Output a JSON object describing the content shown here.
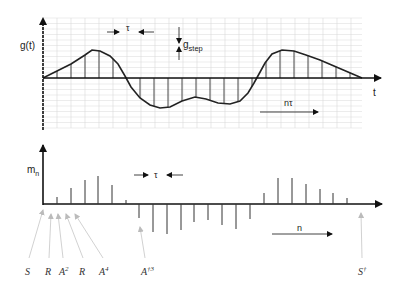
{
  "top_plot": {
    "y_label": "g(t)",
    "x_label": "t",
    "tau_label": "τ",
    "gstep_label_main": "g",
    "gstep_label_sub": "step",
    "ntau_label": "nτ",
    "origin": [
      43,
      78
    ],
    "tau_px": 14,
    "grid": {
      "x0": 43,
      "x1": 362,
      "y0": 18,
      "y1": 128,
      "dx": 14,
      "dy": 5.5
    },
    "curve_points": [
      [
        43,
        78
      ],
      [
        57,
        71
      ],
      [
        71,
        64
      ],
      [
        85,
        55
      ],
      [
        92,
        50
      ],
      [
        100,
        51
      ],
      [
        110,
        56
      ],
      [
        118,
        64
      ],
      [
        125,
        76
      ],
      [
        131,
        87
      ],
      [
        140,
        98
      ],
      [
        150,
        105
      ],
      [
        160,
        108
      ],
      [
        170,
        107
      ],
      [
        182,
        101
      ],
      [
        195,
        97
      ],
      [
        206,
        99
      ],
      [
        218,
        103
      ],
      [
        230,
        104
      ],
      [
        240,
        101
      ],
      [
        248,
        93
      ],
      [
        254,
        83
      ],
      [
        259,
        74
      ],
      [
        265,
        63
      ],
      [
        272,
        54
      ],
      [
        282,
        50
      ],
      [
        294,
        51
      ],
      [
        306,
        55
      ],
      [
        320,
        60
      ],
      [
        334,
        66
      ],
      [
        348,
        72
      ],
      [
        362,
        78
      ]
    ],
    "stems_x": [
      57,
      71,
      85,
      99,
      113,
      126,
      140,
      154,
      168,
      182,
      196,
      210,
      224,
      238,
      252,
      266,
      280,
      294,
      308,
      322,
      336,
      350
    ],
    "colors": {
      "curve": "#222222",
      "grid": "#d8d8d8",
      "axis": "#111111"
    }
  },
  "bottom_plot": {
    "y_label_main": "m",
    "y_label_sub": "n",
    "tau_label": "τ",
    "n_label": "n",
    "origin": [
      43,
      204
    ],
    "stems": [
      {
        "x": 57,
        "y": 197
      },
      {
        "x": 71,
        "y": 188
      },
      {
        "x": 85,
        "y": 180
      },
      {
        "x": 98,
        "y": 176
      },
      {
        "x": 112,
        "y": 185
      },
      {
        "x": 126,
        "y": 200
      },
      {
        "x": 139,
        "y": 218
      },
      {
        "x": 153,
        "y": 232
      },
      {
        "x": 167,
        "y": 234
      },
      {
        "x": 181,
        "y": 230
      },
      {
        "x": 194,
        "y": 222
      },
      {
        "x": 208,
        "y": 220
      },
      {
        "x": 222,
        "y": 225
      },
      {
        "x": 236,
        "y": 229
      },
      {
        "x": 250,
        "y": 219
      },
      {
        "x": 264,
        "y": 193
      },
      {
        "x": 278,
        "y": 178
      },
      {
        "x": 292,
        "y": 178
      },
      {
        "x": 306,
        "y": 184
      },
      {
        "x": 320,
        "y": 189
      },
      {
        "x": 333,
        "y": 193
      },
      {
        "x": 347,
        "y": 198
      }
    ],
    "annotations": [
      {
        "label": "S",
        "sup": "",
        "x": 25,
        "tip": [
          43,
          209
        ]
      },
      {
        "label": "R",
        "sup": "",
        "x": 45,
        "tip": [
          51,
          213
        ]
      },
      {
        "label": "A",
        "sup": "2",
        "x": 59,
        "tip": [
          58,
          213
        ]
      },
      {
        "label": "R",
        "sup": "",
        "x": 79,
        "tip": [
          66,
          213
        ]
      },
      {
        "label": "A",
        "sup": "4",
        "x": 99,
        "tip": [
          75,
          213
        ]
      },
      {
        "label": "A",
        "sup": "†3",
        "x": 141,
        "tip": [
          140,
          226
        ]
      },
      {
        "label": "S",
        "sup": "†",
        "x": 358,
        "tip": [
          361,
          212
        ]
      }
    ]
  }
}
